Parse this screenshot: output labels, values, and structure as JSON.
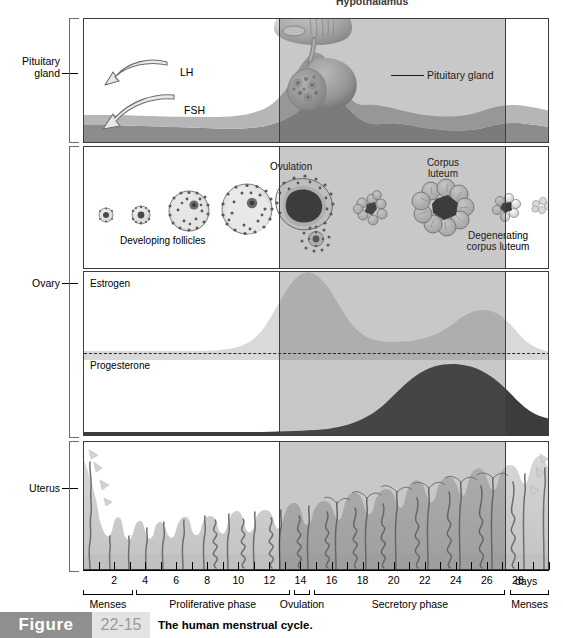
{
  "figure": {
    "word": "Figure",
    "number": "22-15",
    "caption": "The human menstrual cycle."
  },
  "side_labels": [
    {
      "name": "pituitary-gland",
      "text": "Pituitary\ngland",
      "line1": "Pituitary",
      "line2": "gland"
    },
    {
      "name": "ovary",
      "text": "Ovary",
      "line1": "Ovary",
      "line2": ""
    },
    {
      "name": "uterus",
      "text": "Uterus",
      "line1": "Uterus",
      "line2": ""
    }
  ],
  "pituitary_panel": {
    "hypothalamus_label": "Hypothalamus",
    "pituitary_label": "Pituitary gland",
    "lh_label": "LH",
    "fsh_label": "FSH"
  },
  "ovary_panel": {
    "developing_follicles": "Developing follicles",
    "ovulation": "Ovulation",
    "corpus_luteum_line1": "Corpus",
    "corpus_luteum_line2": "luteum",
    "degenerating_line1": "Degenerating",
    "degenerating_line2": "corpus luteum"
  },
  "hormone_panel": {
    "estrogen_label": "Estrogen",
    "progesterone_label": "Progesterone"
  },
  "axis": {
    "unit_label": "days",
    "day_labels": [
      "2",
      "4",
      "6",
      "8",
      "10",
      "12",
      "14",
      "16",
      "18",
      "20",
      "22",
      "24",
      "26",
      "28"
    ],
    "phases": [
      {
        "name": "menses-early",
        "label": "Menses",
        "start_day": 0,
        "end_day": 3.2
      },
      {
        "name": "proliferative",
        "label": "Proliferative phase",
        "start_day": 3.4,
        "end_day": 13.3
      },
      {
        "name": "ovulation",
        "label": "Ovulation",
        "start_day": 13.6,
        "end_day": 14.6
      },
      {
        "name": "secretory",
        "label": "Secretory phase",
        "start_day": 14.9,
        "end_day": 27.2
      },
      {
        "name": "menses-late",
        "label": "Menses",
        "start_day": 27.5,
        "end_day": 30
      }
    ]
  },
  "colors": {
    "lh_fsh_light": "#b6b6b6",
    "lh_fsh_dark": "#8c8c8c",
    "estrogen": "#d9d9d9",
    "progesterone": "#3c3c3c",
    "endometrium": "#c9c9c9",
    "shade_overlay": "#585858",
    "frame": "#3d3d3d",
    "caption_bar": "#8f8f8f",
    "caption_num_bg": "#e3e3e3"
  },
  "chart_data": {
    "type": "area",
    "title": "The human menstrual cycle",
    "xlabel": "days",
    "xlim": [
      0,
      30
    ],
    "x_ticks": [
      1,
      2,
      3,
      4,
      5,
      6,
      7,
      8,
      9,
      10,
      11,
      12,
      13,
      14,
      15,
      16,
      17,
      18,
      19,
      20,
      21,
      22,
      23,
      24,
      25,
      26,
      27,
      28,
      29,
      30
    ],
    "x_tick_labels": [
      "",
      "2",
      "",
      "4",
      "",
      "6",
      "",
      "8",
      "",
      "10",
      "",
      "12",
      "",
      "14",
      "",
      "16",
      "",
      "18",
      "",
      "20",
      "",
      "22",
      "",
      "24",
      "",
      "26",
      "",
      "28",
      "",
      ""
    ],
    "grid": false,
    "legend": "none",
    "shaded_region": {
      "label": "secretory phase shading",
      "start_day": 14,
      "end_day": 28
    },
    "series": [
      {
        "name": "LH",
        "panel": "pituitary",
        "note": "low baseline, sharp surge peaking at day 14",
        "x": [
          0,
          2,
          4,
          6,
          8,
          10,
          11,
          12,
          13,
          13.6,
          14,
          14.4,
          15,
          16,
          18,
          20,
          22,
          24,
          26,
          28,
          30
        ],
        "values": [
          12,
          12,
          12,
          12,
          13,
          15,
          18,
          25,
          48,
          82,
          100,
          78,
          42,
          22,
          15,
          13,
          12,
          12,
          12,
          13,
          14
        ]
      },
      {
        "name": "FSH",
        "panel": "pituitary",
        "note": "modest baseline, small mid-cycle rise",
        "x": [
          0,
          2,
          4,
          6,
          8,
          10,
          12,
          13,
          14,
          15,
          16,
          18,
          20,
          22,
          24,
          26,
          28,
          30
        ],
        "values": [
          30,
          31,
          30,
          28,
          26,
          25,
          27,
          34,
          42,
          36,
          28,
          24,
          22,
          21,
          21,
          23,
          28,
          31
        ]
      },
      {
        "name": "Estrogen",
        "panel": "hormones",
        "note": "rises through follicular phase, peaks day 12-13, dips, second luteal peak day 21-22",
        "x": [
          0,
          2,
          4,
          6,
          8,
          9,
          10,
          11,
          12,
          13,
          14,
          15,
          16,
          17,
          18,
          19,
          20,
          21,
          22,
          23,
          24,
          25,
          26,
          27,
          28,
          30
        ],
        "values": [
          14,
          12,
          12,
          13,
          22,
          34,
          52,
          74,
          92,
          96,
          82,
          66,
          54,
          48,
          46,
          48,
          54,
          62,
          66,
          64,
          56,
          44,
          30,
          18,
          14,
          16
        ]
      },
      {
        "name": "Progesterone",
        "panel": "hormones",
        "note": "low in follicular phase, rises after ovulation, peaks day 21-22, falls before menses",
        "x": [
          0,
          2,
          4,
          6,
          8,
          10,
          12,
          13,
          14,
          15,
          16,
          17,
          18,
          19,
          20,
          21,
          22,
          23,
          24,
          25,
          26,
          27,
          28,
          30
        ],
        "values": [
          14,
          11,
          9,
          8,
          9,
          11,
          14,
          18,
          26,
          38,
          52,
          66,
          78,
          88,
          94,
          96,
          92,
          84,
          72,
          58,
          44,
          32,
          24,
          20
        ]
      },
      {
        "name": "Endometrial thickness",
        "panel": "uterus",
        "note": "shed during menses, thickens through proliferative and secretory phases, sheds again at day 28",
        "x": [
          0,
          1,
          2,
          3,
          4,
          6,
          8,
          10,
          12,
          14,
          16,
          18,
          20,
          22,
          24,
          26,
          27,
          28,
          30
        ],
        "values": [
          95,
          75,
          48,
          26,
          28,
          34,
          42,
          52,
          62,
          72,
          80,
          86,
          92,
          96,
          98,
          98,
          92,
          30,
          88
        ]
      }
    ],
    "ovary_stages": [
      {
        "day": 1,
        "stage": "primordial follicle",
        "size": 6
      },
      {
        "day": 3,
        "stage": "primary follicle",
        "size": 8
      },
      {
        "day": 6,
        "stage": "secondary follicle",
        "size": 17
      },
      {
        "day": 10,
        "stage": "antral follicle",
        "size": 21
      },
      {
        "day": 14,
        "stage": "ovulation",
        "size": 27
      },
      {
        "day": 16,
        "stage": "early corpus luteum",
        "size": 14
      },
      {
        "day": 21,
        "stage": "corpus luteum",
        "size": 24
      },
      {
        "day": 25,
        "stage": "degenerating corpus luteum",
        "size": 13
      },
      {
        "day": 28,
        "stage": "corpus albicans",
        "size": 9
      }
    ]
  }
}
